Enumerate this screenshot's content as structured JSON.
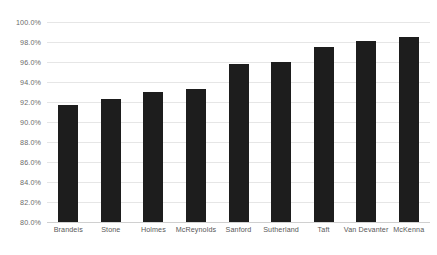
{
  "chart_data": {
    "type": "bar",
    "title": "",
    "subtitle": "",
    "xlabel": "",
    "ylabel": "",
    "categories": [
      "Brandeis",
      "Stone",
      "Holmes",
      "McReynolds",
      "Sanford",
      "Sutherland",
      "Taft",
      "Van Devanter",
      "McKenna"
    ],
    "values": [
      91.7,
      92.3,
      93.0,
      93.3,
      95.8,
      96.0,
      97.5,
      98.1,
      98.5
    ],
    "ylim": [
      80.0,
      100.0
    ],
    "ytick_step": 2.0,
    "ytick_labels": [
      "100.0%",
      "98.0%",
      "96.0%",
      "94.0%",
      "92.0%",
      "90.0%",
      "88.0%",
      "86.0%",
      "84.0%",
      "82.0%",
      "80.0%"
    ],
    "ytick_values": [
      100.0,
      98.0,
      96.0,
      94.0,
      92.0,
      90.0,
      88.0,
      86.0,
      84.0,
      82.0,
      80.0
    ],
    "grid": true,
    "grid_axis": "y",
    "legend": false,
    "legend_position": "none",
    "value_labels": false,
    "series": [
      {
        "name": "",
        "color": "#1d1d1d",
        "values": [
          91.7,
          92.3,
          93.0,
          93.3,
          95.8,
          96.0,
          97.5,
          98.1,
          98.5
        ]
      }
    ],
    "colors": {
      "bar": "#1d1d1d",
      "gridline": "#e6e6e6",
      "baseline": "#d0d0d0",
      "ytick_text": "#6b6b6b",
      "xtick_text": "#585858",
      "background": "#ffffff"
    }
  }
}
